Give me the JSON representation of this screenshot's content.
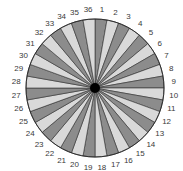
{
  "diagram": {
    "type": "radial-sector-wheel",
    "segment_count": 36,
    "center": {
      "x": 95,
      "y": 88
    },
    "radius": 69,
    "label_radius": 79,
    "colors": {
      "dark": "#8c8c8c",
      "light": "#d9d9d9",
      "outline": "#2e2e2e",
      "hub": "#000000",
      "label": "#3a3a3a"
    },
    "labels": [
      "1",
      "2",
      "3",
      "4",
      "5",
      "6",
      "7",
      "8",
      "9",
      "10",
      "11",
      "12",
      "13",
      "14",
      "15",
      "16",
      "17",
      "18",
      "19",
      "20",
      "21",
      "22",
      "23",
      "24",
      "25",
      "26",
      "27",
      "28",
      "29",
      "30",
      "31",
      "32",
      "33",
      "34",
      "35",
      "36"
    ],
    "pattern": "alternating: odd segments dark, even segments light, clockwise from 12 o'clock"
  }
}
